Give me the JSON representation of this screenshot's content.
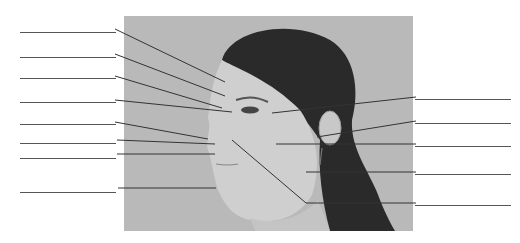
{
  "diagram": {
    "title": "",
    "colors": {
      "background": "#ffffff",
      "photo_bg": "#b9b9b9",
      "line": "#333333",
      "hair": "#2a2a2a",
      "skin": "#cfcfcf"
    },
    "left_labels": [
      {
        "text": "",
        "y": 32,
        "target": [
          225,
          82
        ]
      },
      {
        "text": "",
        "y": 57,
        "target": [
          225,
          96
        ]
      },
      {
        "text": "",
        "y": 78,
        "target": [
          222,
          108
        ]
      },
      {
        "text": "",
        "y": 102,
        "target": [
          232,
          112
        ]
      },
      {
        "text": "",
        "y": 124,
        "target": [
          208,
          139
        ]
      },
      {
        "text": "",
        "y": 143,
        "target": [
          215,
          144
        ]
      },
      {
        "text": "",
        "y": 158,
        "target": [
          215,
          154
        ]
      },
      {
        "text": "",
        "y": 192,
        "target": [
          216,
          188
        ]
      }
    ],
    "right_labels": [
      {
        "text": "",
        "y": 98,
        "target": [
          272,
          113
        ]
      },
      {
        "text": "",
        "y": 123,
        "target": [
          317,
          137
        ]
      },
      {
        "text": "",
        "y": 146,
        "target": [
          276,
          144
        ]
      },
      {
        "text": "",
        "y": 174,
        "target": [
          306,
          172
        ]
      },
      {
        "text": "",
        "y": 205,
        "target": [
          232,
          140
        ]
      }
    ]
  }
}
